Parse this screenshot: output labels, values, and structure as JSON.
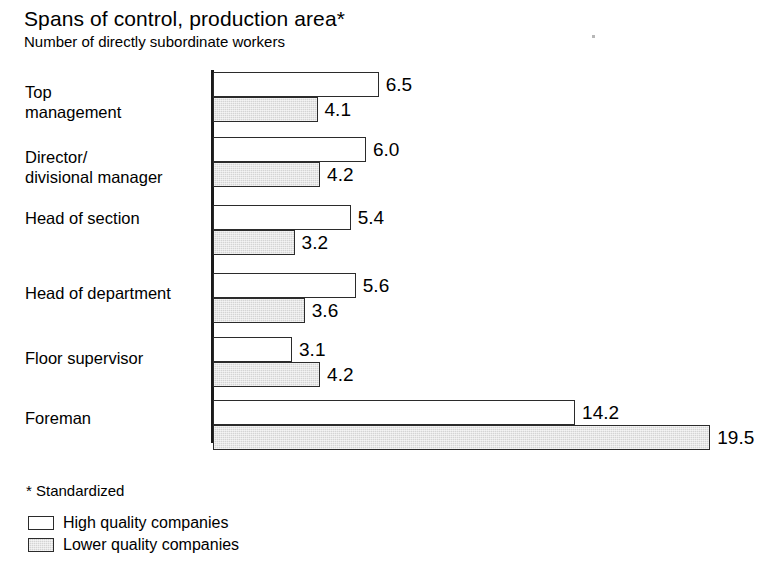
{
  "header": {
    "title": "Spans of control, production area*",
    "subtitle": "Number of directly subordinate workers"
  },
  "footnote": "* Standardized",
  "legend": {
    "position": "bottom-left",
    "items": [
      {
        "label": "High quality companies",
        "swatch": "white-square-icon",
        "color": "#ffffff"
      },
      {
        "label": "Lower quality companies",
        "swatch": "gray-square-icon",
        "color": "#d4d4d4"
      }
    ]
  },
  "chart_data": {
    "type": "bar",
    "orientation": "horizontal",
    "title": "Spans of control, production area*",
    "subtitle": "Number of directly subordinate workers",
    "xlabel": "",
    "ylabel": "",
    "grid": false,
    "xlim": [
      0,
      19.5
    ],
    "categories": [
      "Top\nmanagement",
      "Director/\ndivisional manager",
      "Head of section",
      "Head of department",
      "Floor supervisor",
      "Foreman"
    ],
    "series": [
      {
        "name": "High quality companies",
        "color": "#ffffff",
        "values": [
          6.5,
          6.0,
          5.4,
          5.6,
          3.1,
          14.2
        ],
        "labels": [
          "6.5",
          "6.0",
          "5.4",
          "5.6",
          "3.1",
          "14.2"
        ]
      },
      {
        "name": "Lower quality companies",
        "color": "#d4d4d4",
        "values": [
          4.1,
          4.2,
          3.2,
          3.6,
          4.2,
          19.5
        ],
        "labels": [
          "4.1",
          "4.2",
          "3.2",
          "3.6",
          "4.2",
          "19.5"
        ]
      }
    ]
  },
  "layout": {
    "axis_x": 213,
    "px_per_unit": 25.5,
    "bar_height": 25,
    "group_tops": [
      72,
      137,
      205,
      273,
      337,
      400
    ],
    "label_tops": [
      82,
      147,
      208,
      283,
      348,
      408
    ]
  }
}
